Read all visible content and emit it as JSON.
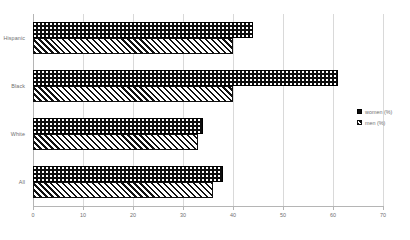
{
  "chart_data": {
    "type": "bar",
    "orientation": "horizontal",
    "title": "",
    "subtitle": "",
    "xlabel": "",
    "ylabel": "",
    "categories": [
      "Hispanic",
      "Black",
      "White",
      "All"
    ],
    "series": [
      {
        "name": "women (%)",
        "values": [
          44,
          61,
          34,
          38
        ]
      },
      {
        "name": "men (%)",
        "values": [
          40,
          40,
          33,
          36
        ]
      }
    ],
    "xlim": [
      0,
      70
    ],
    "xticks": [
      0,
      10,
      20,
      30,
      40,
      50,
      60,
      70
    ],
    "xtick_labels": [
      "0",
      "10",
      "20",
      "30",
      "40",
      "50",
      "60",
      "70"
    ],
    "grid": true,
    "grid_axis": "x",
    "legend_position": "right",
    "colors": {
      "women_fill": "#0d0d0d",
      "men_fill": "#ffffff",
      "men_hatch": "#111111",
      "gridline": "#d9d9d9",
      "axis": "#b5b5b5",
      "text": "#6f6f6f",
      "background": "#ffffff"
    }
  },
  "legend": {
    "items": [
      {
        "label": "women (%)",
        "pattern": "dotted-dark"
      },
      {
        "label": "men (%)",
        "pattern": "diagonal-hatch"
      }
    ]
  }
}
